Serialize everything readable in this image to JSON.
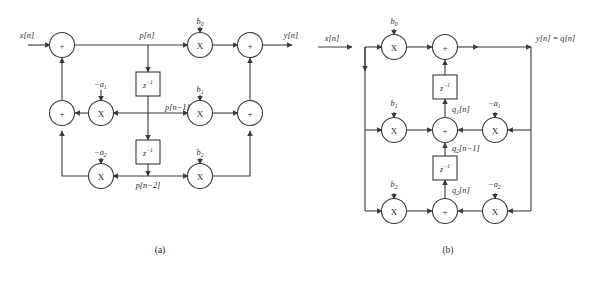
{
  "figure": {
    "kind": "signal-flow-graph",
    "captions": {
      "a": "(a)",
      "b": "(b)"
    },
    "stroke_color": "#3a3a3a",
    "text_color": "#2b2b2b",
    "background": "#ffffff"
  },
  "diagram_a": {
    "id": "direct-form-I",
    "input_label": "x[n]",
    "output_label": "y[n]",
    "signals": {
      "p_n": "p[n]",
      "p_n1": "p[n−1]",
      "p_n2": "p[n−2]"
    },
    "feedforward_coeffs": [
      {
        "base": "b",
        "sub": "0",
        "text": "b0"
      },
      {
        "base": "b",
        "sub": "1",
        "text": "b1"
      },
      {
        "base": "b",
        "sub": "2",
        "text": "b2"
      }
    ],
    "feedback_coeffs": [
      {
        "base": "a",
        "sub": "1",
        "text": "−a1"
      },
      {
        "base": "a",
        "sub": "2",
        "text": "−a2"
      }
    ],
    "delay_blocks": [
      {
        "label": "z",
        "exponent": "−1"
      },
      {
        "label": "z",
        "exponent": "−1"
      }
    ],
    "adder_glyph": "+",
    "multiplier_glyph": "X",
    "adders": 5,
    "multipliers": 5
  },
  "diagram_b": {
    "id": "transposed-direct-form-II",
    "input_label": "x[n]",
    "output_label": "y[n] = q[n]",
    "signals": {
      "q1_n": "q1[n]",
      "q2_n1": "q2[n−1]",
      "q2_n": "q2[n]"
    },
    "feedforward_coeffs": [
      {
        "base": "b",
        "sub": "0",
        "text": "b0"
      },
      {
        "base": "b",
        "sub": "1",
        "text": "b1"
      },
      {
        "base": "b",
        "sub": "2",
        "text": "b2"
      }
    ],
    "feedback_coeffs": [
      {
        "base": "a",
        "sub": "1",
        "text": "−a1"
      },
      {
        "base": "a",
        "sub": "2",
        "text": "−a2"
      }
    ],
    "delay_blocks": [
      {
        "label": "z",
        "exponent": "−1"
      },
      {
        "label": "z",
        "exponent": "−1"
      }
    ],
    "adder_glyph": "+",
    "multiplier_glyph": "X",
    "adders": 3,
    "multipliers": 5
  }
}
